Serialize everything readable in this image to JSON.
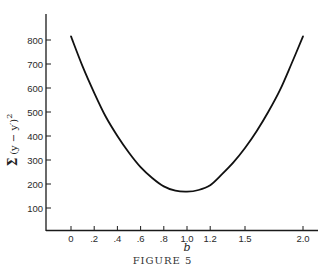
{
  "chart_data": {
    "type": "line",
    "title": "",
    "xlabel": "b",
    "ylabel": "Σ (y − y')²",
    "x_ticks": [
      0,
      0.2,
      0.4,
      0.6,
      0.8,
      1.0,
      1.2,
      1.5,
      2.0
    ],
    "x_tick_labels": [
      "0",
      ".2",
      ".4",
      ".6",
      ".8",
      "1.0",
      "1.2",
      "1.5",
      "2.0"
    ],
    "y_ticks": [
      100,
      200,
      300,
      400,
      500,
      600,
      700,
      800
    ],
    "y_tick_labels": [
      "100",
      "200",
      "300",
      "400",
      "500",
      "600",
      "700",
      "800"
    ],
    "xlim": [
      -0.1,
      2.15
    ],
    "ylim": [
      0,
      900
    ],
    "grid": false,
    "legend": null,
    "series": [
      {
        "name": "sum of squared deviations",
        "x": [
          0,
          0.1,
          0.2,
          0.3,
          0.4,
          0.5,
          0.6,
          0.7,
          0.8,
          0.9,
          1.0,
          1.1,
          1.2,
          1.3,
          1.4,
          1.5,
          1.6,
          1.7,
          1.8,
          1.9,
          2.0
        ],
        "y": [
          815,
          690,
          580,
          480,
          400,
          330,
          270,
          225,
          190,
          172,
          168,
          175,
          195,
          240,
          290,
          350,
          420,
          500,
          590,
          700,
          815
        ]
      }
    ]
  },
  "caption": "FIGURE 5"
}
